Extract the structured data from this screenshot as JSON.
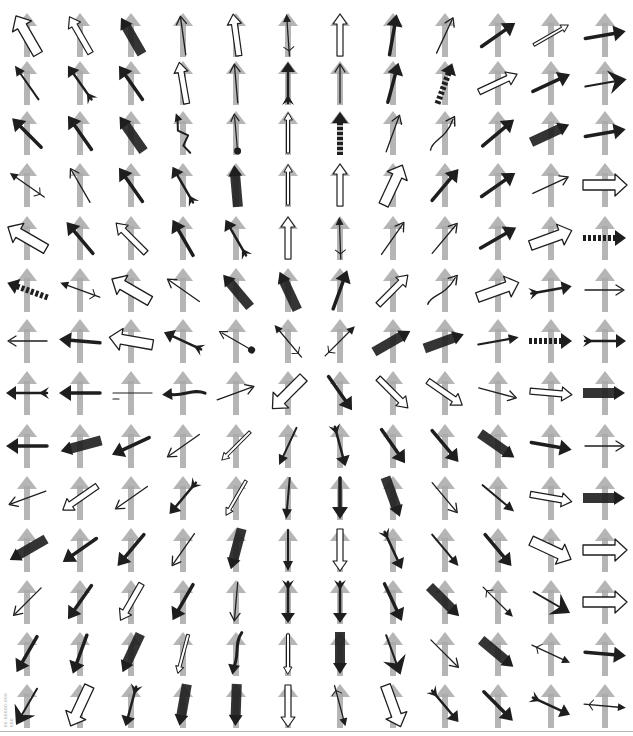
{
  "sheet": {
    "title": "",
    "columns": 12,
    "rows": 14,
    "side_code": "00-00000-000 000",
    "colors": {
      "reference_arrow": "#a8a8a8",
      "probe_arrow": "#1e1e1e",
      "background": "#ffffff",
      "rule": "#b5b5b5"
    },
    "col_centers": [
      27,
      80,
      131,
      183,
      236,
      288,
      340,
      393,
      445,
      498,
      551,
      605
    ],
    "row_centers": [
      35,
      83,
      133,
      185,
      238,
      290,
      341,
      393,
      446,
      498,
      550,
      602,
      654,
      706
    ],
    "cells": [
      [
        {
          "a": -30,
          "s": "outline-wide"
        },
        {
          "a": -30,
          "s": "outline"
        },
        {
          "a": -30,
          "s": "bar"
        },
        {
          "a": -8,
          "s": "thin"
        },
        {
          "a": -8,
          "s": "outline"
        },
        {
          "a": -4,
          "s": "feather"
        },
        {
          "a": 0,
          "s": "outline"
        },
        {
          "a": 10,
          "s": "solid"
        },
        {
          "a": 25,
          "s": "thin"
        },
        {
          "a": 55,
          "s": "solid"
        },
        {
          "a": 60,
          "s": "thin-outline"
        },
        {
          "a": 80,
          "s": "solid"
        }
      ],
      [
        {
          "a": -35,
          "s": "solid-thin"
        },
        {
          "a": -35,
          "s": "feather-bold"
        },
        {
          "a": -35,
          "s": "solid"
        },
        {
          "a": -10,
          "s": "outline"
        },
        {
          "a": -5,
          "s": "thin"
        },
        {
          "a": 0,
          "s": "feather-bold"
        },
        {
          "a": 0,
          "s": "thin"
        },
        {
          "a": 15,
          "s": "solid"
        },
        {
          "a": 20,
          "s": "dashed-bold"
        },
        {
          "a": 65,
          "s": "outline"
        },
        {
          "a": 65,
          "s": "solid"
        },
        {
          "a": 80,
          "s": "wing"
        }
      ],
      [
        {
          "a": -45,
          "s": "solid"
        },
        {
          "a": -35,
          "s": "solid"
        },
        {
          "a": -35,
          "s": "bar"
        },
        {
          "a": -20,
          "s": "zigzag"
        },
        {
          "a": -5,
          "s": "ball"
        },
        {
          "a": 0,
          "s": "thin-outline"
        },
        {
          "a": 0,
          "s": "dashed-bold"
        },
        {
          "a": 20,
          "s": "thin"
        },
        {
          "a": 30,
          "s": "curve"
        },
        {
          "a": 50,
          "s": "solid"
        },
        {
          "a": 65,
          "s": "bar"
        },
        {
          "a": 80,
          "s": "solid"
        }
      ],
      [
        {
          "a": -55,
          "s": "feather"
        },
        {
          "a": -30,
          "s": "thin"
        },
        {
          "a": -35,
          "s": "solid"
        },
        {
          "a": -30,
          "s": "feather-bold"
        },
        {
          "a": -5,
          "s": "bar"
        },
        {
          "a": 0,
          "s": "thin-outline"
        },
        {
          "a": 0,
          "s": "outline"
        },
        {
          "a": 25,
          "s": "outline-wide"
        },
        {
          "a": 40,
          "s": "solid"
        },
        {
          "a": 55,
          "s": "solid"
        },
        {
          "a": 65,
          "s": "thin"
        },
        {
          "a": 90,
          "s": "outline-wide"
        }
      ],
      [
        {
          "a": -60,
          "s": "outline-wide"
        },
        {
          "a": -40,
          "s": "solid"
        },
        {
          "a": -45,
          "s": "outline"
        },
        {
          "a": -30,
          "s": "solid"
        },
        {
          "a": -30,
          "s": "feather-bold"
        },
        {
          "a": 0,
          "s": "outline"
        },
        {
          "a": -2,
          "s": "feather"
        },
        {
          "a": 35,
          "s": "thin"
        },
        {
          "a": 40,
          "s": "thin"
        },
        {
          "a": 60,
          "s": "solid"
        },
        {
          "a": 70,
          "s": "outline-wide"
        },
        {
          "a": 90,
          "s": "dashed-bold"
        }
      ],
      [
        {
          "a": -70,
          "s": "dashed-bold"
        },
        {
          "a": -70,
          "s": "feather"
        },
        {
          "a": -60,
          "s": "outline-wide"
        },
        {
          "a": -55,
          "s": "thin"
        },
        {
          "a": -40,
          "s": "bar"
        },
        {
          "a": -25,
          "s": "bar"
        },
        {
          "a": 20,
          "s": "solid"
        },
        {
          "a": 45,
          "s": "outline"
        },
        {
          "a": 40,
          "s": "curve"
        },
        {
          "a": 70,
          "s": "outline-wide"
        },
        {
          "a": 80,
          "s": "feather-bold"
        },
        {
          "a": 90,
          "s": "thin"
        }
      ],
      [
        {
          "a": -90,
          "s": "thin"
        },
        {
          "a": -85,
          "s": "solid"
        },
        {
          "a": -80,
          "s": "outline-wide"
        },
        {
          "a": -65,
          "s": "feather-bold"
        },
        {
          "a": -60,
          "s": "ball"
        },
        {
          "a": -40,
          "s": "feather"
        },
        {
          "a": 45,
          "s": "feather"
        },
        {
          "a": 60,
          "s": "bar"
        },
        {
          "a": 70,
          "s": "bar"
        },
        {
          "a": 80,
          "s": "solid-thin"
        },
        {
          "a": 90,
          "s": "dashed-bold"
        },
        {
          "a": 90,
          "s": "feather-bold"
        }
      ],
      [
        {
          "a": -90,
          "s": "feather-bold"
        },
        {
          "a": -90,
          "s": "solid"
        },
        {
          "a": -90,
          "s": "trident"
        },
        {
          "a": -95,
          "s": "curve-bold"
        },
        {
          "a": 70,
          "s": "thin"
        },
        {
          "a": -135,
          "s": "outline-wide"
        },
        {
          "a": 145,
          "s": "solid"
        },
        {
          "a": 135,
          "s": "outline"
        },
        {
          "a": 125,
          "s": "outline"
        },
        {
          "a": 105,
          "s": "thin"
        },
        {
          "a": 95,
          "s": "outline"
        },
        {
          "a": 90,
          "s": "bar"
        }
      ],
      [
        {
          "a": -90,
          "s": "solid"
        },
        {
          "a": -105,
          "s": "bar"
        },
        {
          "a": -115,
          "s": "solid"
        },
        {
          "a": -125,
          "s": "thin"
        },
        {
          "a": -135,
          "s": "thin-outline"
        },
        {
          "a": -155,
          "s": "solid-thin"
        },
        {
          "a": 165,
          "s": "feather-bold"
        },
        {
          "a": 145,
          "s": "solid"
        },
        {
          "a": 140,
          "s": "solid"
        },
        {
          "a": 125,
          "s": "bar"
        },
        {
          "a": 100,
          "s": "solid"
        },
        {
          "a": 90,
          "s": "thin"
        }
      ],
      [
        {
          "a": -110,
          "s": "thin"
        },
        {
          "a": -125,
          "s": "outline"
        },
        {
          "a": -125,
          "s": "thin"
        },
        {
          "a": -140,
          "s": "feather-bold"
        },
        {
          "a": -150,
          "s": "thin-outline"
        },
        {
          "a": -175,
          "s": "solid-thin"
        },
        {
          "a": 180,
          "s": "solid"
        },
        {
          "a": 160,
          "s": "bar"
        },
        {
          "a": 140,
          "s": "thin"
        },
        {
          "a": 130,
          "s": "solid-thin"
        },
        {
          "a": 100,
          "s": "outline"
        },
        {
          "a": 90,
          "s": "bar"
        }
      ],
      [
        {
          "a": -120,
          "s": "bar"
        },
        {
          "a": -125,
          "s": "solid"
        },
        {
          "a": -140,
          "s": "solid"
        },
        {
          "a": -145,
          "s": "thin"
        },
        {
          "a": -165,
          "s": "bar"
        },
        {
          "a": 180,
          "s": "solid-thin"
        },
        {
          "a": 180,
          "s": "outline"
        },
        {
          "a": 155,
          "s": "feather-bold"
        },
        {
          "a": 140,
          "s": "solid-thin"
        },
        {
          "a": 140,
          "s": "solid"
        },
        {
          "a": 115,
          "s": "outline-wide"
        },
        {
          "a": 90,
          "s": "outline-wide"
        }
      ],
      [
        {
          "a": -135,
          "s": "thin"
        },
        {
          "a": -145,
          "s": "solid"
        },
        {
          "a": -150,
          "s": "outline"
        },
        {
          "a": -150,
          "s": "solid"
        },
        {
          "a": -175,
          "s": "thin"
        },
        {
          "a": 180,
          "s": "feather-bold"
        },
        {
          "a": 180,
          "s": "feather-bold"
        },
        {
          "a": 155,
          "s": "solid"
        },
        {
          "a": 135,
          "s": "bar"
        },
        {
          "a": 135,
          "s": "feather"
        },
        {
          "a": 120,
          "s": "wing"
        },
        {
          "a": 90,
          "s": "outline-wide"
        }
      ],
      [
        {
          "a": -150,
          "s": "solid"
        },
        {
          "a": -160,
          "s": "solid"
        },
        {
          "a": -155,
          "s": "bar"
        },
        {
          "a": -165,
          "s": "thin-outline"
        },
        {
          "a": -170,
          "s": "curve-bold"
        },
        {
          "a": 180,
          "s": "thin-outline"
        },
        {
          "a": 180,
          "s": "bar"
        },
        {
          "a": 160,
          "s": "wing"
        },
        {
          "a": 135,
          "s": "thin"
        },
        {
          "a": 130,
          "s": "bar"
        },
        {
          "a": 115,
          "s": "feather"
        },
        {
          "a": 95,
          "s": "solid"
        }
      ],
      [
        {
          "a": -150,
          "s": "wing"
        },
        {
          "a": -155,
          "s": "outline-wide"
        },
        {
          "a": -165,
          "s": "feather-bold"
        },
        {
          "a": -170,
          "s": "bar"
        },
        {
          "a": -178,
          "s": "bar"
        },
        {
          "a": 180,
          "s": "outline"
        },
        {
          "a": 165,
          "s": "feather"
        },
        {
          "a": 160,
          "s": "outline-wide"
        },
        {
          "a": 140,
          "s": "feather-bold"
        },
        {
          "a": 135,
          "s": "solid"
        },
        {
          "a": 115,
          "s": "feather-bold"
        },
        {
          "a": 95,
          "s": "feather"
        }
      ]
    ]
  }
}
